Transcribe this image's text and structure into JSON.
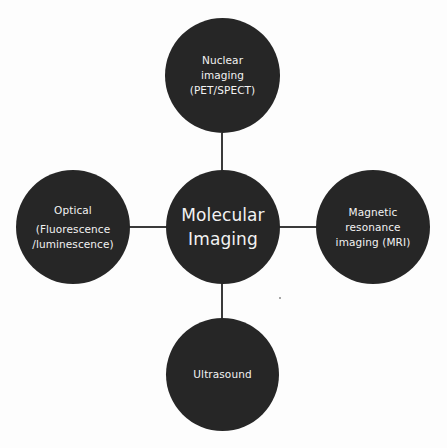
{
  "diagram": {
    "title": "Molecular Imaging",
    "center": {
      "lines": [
        "Molecular",
        "Imaging"
      ]
    },
    "nodes": {
      "top": {
        "lines": [
          "Nuclear",
          "imaging",
          "(PET/SPECT)"
        ]
      },
      "left": {
        "lines": [
          "Optical",
          "(Fluorescence",
          "/luminescence)"
        ]
      },
      "right": {
        "lines": [
          "Magnetic",
          "resonance",
          "imaging (MRI)"
        ]
      },
      "bottom": {
        "lines": [
          "Ultrasound"
        ]
      }
    },
    "colors": {
      "node_fill": "#262626",
      "node_text": "#f2f2f2",
      "connector": "#3a3a3a",
      "background": "#fdfdfd"
    }
  }
}
